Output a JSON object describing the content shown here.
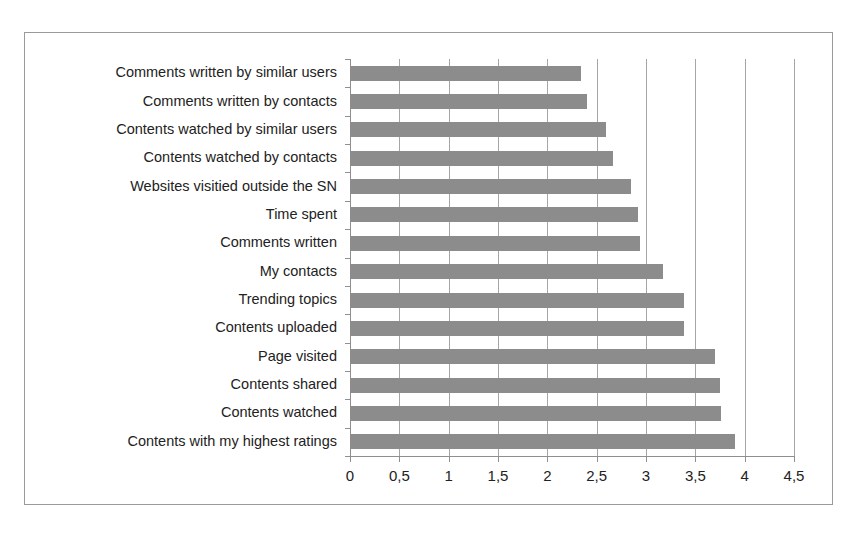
{
  "chart_data": {
    "type": "bar",
    "orientation": "horizontal",
    "title": "",
    "xlabel": "",
    "ylabel": "",
    "xlim": [
      0,
      4.5
    ],
    "grid": true,
    "legend": "none",
    "bar_color": "#8c8c8c",
    "axis_color": "#8f8f8f",
    "frame_color": "#9a9a9a",
    "decimal_separator": ",",
    "xticks": [
      0,
      0.5,
      1,
      1.5,
      2,
      2.5,
      3,
      3.5,
      4,
      4.5
    ],
    "xtick_labels": [
      "0",
      "0,5",
      "1",
      "1,5",
      "2",
      "2,5",
      "3",
      "3,5",
      "4",
      "4,5"
    ],
    "categories": [
      "Comments written by similar users",
      "Comments written by contacts",
      "Contents watched by similar users",
      "Contents watched by contacts",
      "Websites visitied outside the SN",
      "Time spent",
      "Comments written",
      "My contacts",
      "Trending topics",
      "Contents uploaded",
      "Page visited",
      "Contents shared",
      "Contents watched",
      "Contents with my highest ratings"
    ],
    "values": [
      2.34,
      2.4,
      2.59,
      2.67,
      2.85,
      2.92,
      2.94,
      3.17,
      3.39,
      3.39,
      3.7,
      3.75,
      3.76,
      3.9
    ]
  }
}
